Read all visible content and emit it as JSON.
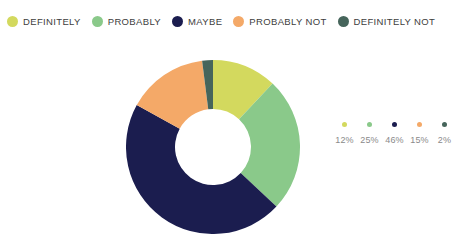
{
  "title_sliver": "",
  "chart_data": {
    "type": "pie",
    "variant": "donut",
    "title": "",
    "xlabel": "",
    "ylabel": "",
    "legend_position": "top",
    "grid": false,
    "start_angle_deg": 0,
    "direction": "clockwise",
    "categories": [
      "DEFINITELY",
      "PROBABLY",
      "MAYBE",
      "PROBABLY NOT",
      "DEFINITELY NOT"
    ],
    "values": [
      12,
      25,
      46,
      15,
      2
    ],
    "value_labels": [
      "12%",
      "25%",
      "46%",
      "15%",
      "2%"
    ],
    "unit": "%",
    "colors": [
      "#d3d95e",
      "#8ac98a",
      "#1b1d4f",
      "#f4a968",
      "#46655b"
    ],
    "slices": [
      {
        "label": "DEFINITELY",
        "value": 12,
        "value_label": "12%",
        "color": "#d3d95e"
      },
      {
        "label": "PROBABLY",
        "value": 25,
        "value_label": "25%",
        "color": "#8ac98a"
      },
      {
        "label": "MAYBE",
        "value": 46,
        "value_label": "46%",
        "color": "#1b1d4f"
      },
      {
        "label": "PROBABLY NOT",
        "value": 15,
        "value_label": "15%",
        "color": "#f4a968"
      },
      {
        "label": "DEFINITELY NOT",
        "value": 2,
        "value_label": "2%",
        "color": "#46655b"
      }
    ]
  },
  "legend_top": {
    "items": [
      {
        "label": "DEFINITELY",
        "color": "#d3d95e"
      },
      {
        "label": "PROBABLY",
        "color": "#8ac98a"
      },
      {
        "label": "MAYBE",
        "color": "#1b1d4f"
      },
      {
        "label": "PROBABLY NOT",
        "color": "#f4a968"
      },
      {
        "label": "DEFINITELY NOT",
        "color": "#46655b"
      }
    ]
  },
  "legend_right": {
    "items": [
      {
        "percent": "12%",
        "color": "#d3d95e"
      },
      {
        "percent": "25%",
        "color": "#8ac98a"
      },
      {
        "percent": "46%",
        "color": "#1b1d4f"
      },
      {
        "percent": "15%",
        "color": "#f4a968"
      },
      {
        "percent": "2%",
        "color": "#46655b"
      }
    ]
  },
  "geometry": {
    "center_x": 213,
    "center_y": 147,
    "outer_radius": 87,
    "inner_radius": 38
  }
}
